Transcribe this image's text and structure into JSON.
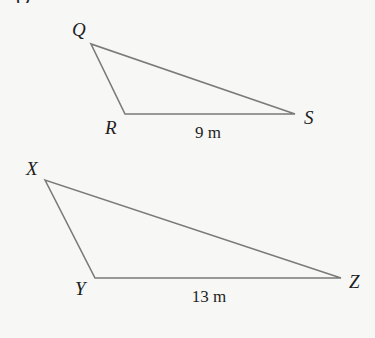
{
  "diagram": {
    "type": "similar-triangles",
    "stroke_color": "#777777",
    "background": "#f7f7f5",
    "top_fragment": "Q",
    "triangles": [
      {
        "name": "QRS",
        "vertices": {
          "Q": {
            "label": "Q",
            "x": 91,
            "y": 44
          },
          "R": {
            "label": "R",
            "x": 125,
            "y": 114
          },
          "S": {
            "label": "S",
            "x": 295,
            "y": 114
          }
        },
        "side_label": {
          "text": "9 m",
          "side": "RS"
        }
      },
      {
        "name": "XYZ",
        "vertices": {
          "X": {
            "label": "X",
            "x": 45,
            "y": 180
          },
          "Y": {
            "label": "Y",
            "x": 95,
            "y": 278
          },
          "Z": {
            "label": "Z",
            "x": 341,
            "y": 278
          }
        },
        "side_label": {
          "text": "13 m",
          "side": "YZ"
        }
      }
    ]
  }
}
